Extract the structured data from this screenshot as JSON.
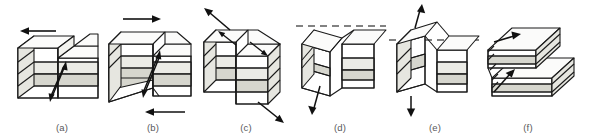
{
  "figure": {
    "background_color": "#ffffff",
    "stroke_color": "#1a1a1a",
    "caption_color": "#58585a",
    "layer_colors": {
      "white_bed": "#ffffff",
      "gray_bed": "#d6d6ce",
      "light_gray_bed": "#ebebe6",
      "side_shade": "#e6e6e0",
      "top_shade": "#fbfbfa"
    },
    "panels": [
      {
        "id": "a",
        "label": "(a)",
        "fault_type": "left-lateral strike-slip",
        "arrows": [
          "top-surface arrow pointing left",
          "paired slip arrows on fault plane"
        ],
        "datum_line": false,
        "x": 12
      },
      {
        "id": "b",
        "label": "(b)",
        "fault_type": "right-lateral strike-slip",
        "arrows": [
          "top arrow pointing right",
          "bottom arrow pointing left",
          "paired slip arrows on fault plane"
        ],
        "datum_line": false,
        "x": 103
      },
      {
        "id": "c",
        "label": "(c)",
        "fault_type": "oblique slip",
        "arrows": [
          "upper-left diagonal arrow",
          "lower-right diagonal arrow",
          "two surface slip arrows"
        ],
        "datum_line": false,
        "x": 196
      },
      {
        "id": "d",
        "label": "(d)",
        "fault_type": "normal fault",
        "arrows": [
          "downward arrow below hanging wall"
        ],
        "datum_line": true,
        "x": 290
      },
      {
        "id": "e",
        "label": "(e)",
        "fault_type": "reverse fault",
        "arrows": [
          "upward arrow above block",
          "downward arrow below block"
        ],
        "datum_line": true,
        "x": 385
      },
      {
        "id": "f",
        "label": "(f)",
        "fault_type": "thrust fault",
        "arrows": [
          "upper bedding-plane arrow",
          "lower bedding-plane arrow"
        ],
        "datum_line": false,
        "x": 478
      }
    ]
  }
}
